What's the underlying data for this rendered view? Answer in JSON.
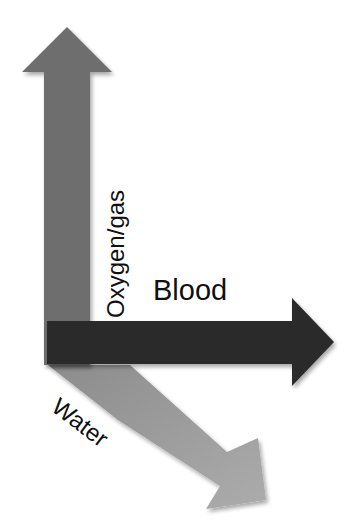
{
  "diagram": {
    "arrows": [
      {
        "id": "oxygen",
        "label": "Oxygen/gas",
        "direction": "up",
        "color": "#6e6e6e"
      },
      {
        "id": "blood",
        "label": "Blood",
        "direction": "right",
        "color": "#2c2c2c"
      },
      {
        "id": "water",
        "label": "Water",
        "direction": "down-right",
        "color": "#9c9c9c"
      }
    ]
  }
}
